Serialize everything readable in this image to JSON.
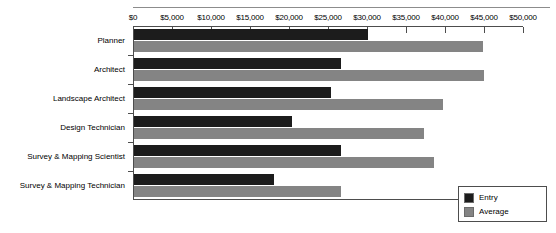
{
  "chart_data": {
    "type": "bar",
    "orientation": "horizontal",
    "title": "",
    "subtitle": "",
    "xlabel": "",
    "ylabel": "",
    "xlim": [
      0,
      50000
    ],
    "grid": false,
    "legend_position": "bottom-right",
    "categories": [
      "Planner",
      "Architect",
      "Landscape Architect",
      "Design Technician",
      "Survey & Mapping Scientist",
      "Survey & Mapping Technician"
    ],
    "series": [
      {
        "name": "Entry",
        "color": "#1c1c1c",
        "values": [
          30000,
          26500,
          25200,
          20300,
          26600,
          17900
        ]
      },
      {
        "name": "Average",
        "color": "#848484",
        "values": [
          44800,
          44900,
          39600,
          37200,
          38500,
          26500
        ]
      }
    ],
    "x_ticks": [
      0,
      5000,
      10000,
      15000,
      20000,
      25000,
      30000,
      35000,
      40000,
      45000,
      50000
    ],
    "x_tick_labels": [
      "$0",
      "$5,000",
      "$10,000",
      "$15,000",
      "$20,000",
      "$25,000",
      "$30,000",
      "$35,000",
      "$40,000",
      "$45,000",
      "$50,000"
    ]
  },
  "legend": {
    "entries": [
      {
        "label": "Entry",
        "color": "#1c1c1c"
      },
      {
        "label": "Average",
        "color": "#848484"
      }
    ]
  }
}
